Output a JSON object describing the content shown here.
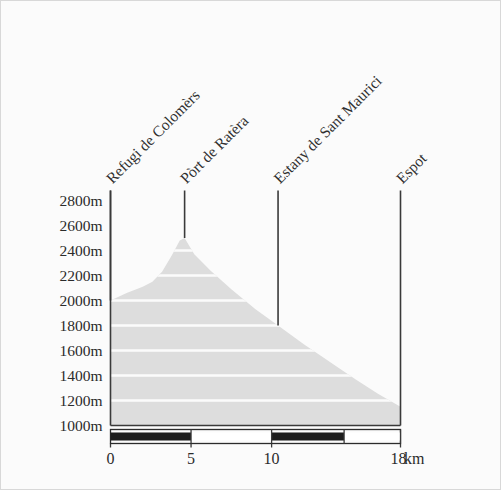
{
  "chart_data": {
    "type": "area",
    "title": "",
    "subtitle": "",
    "xlabel": "",
    "ylabel": "",
    "xunit": "km",
    "yunit": "m",
    "xlim": [
      0,
      18
    ],
    "ylim": [
      1000,
      2900
    ],
    "grid": true,
    "legend": "none",
    "x_ticks": [
      0,
      5,
      10,
      18
    ],
    "x_tick_labels": [
      "0",
      "5",
      "10",
      "18"
    ],
    "y_ticks": [
      1000,
      1200,
      1400,
      1600,
      1800,
      2000,
      2200,
      2400,
      2600,
      2800
    ],
    "y_tick_labels": [
      "1000m",
      "1200m",
      "1400m",
      "1600m",
      "1800m",
      "2000m",
      "2200m",
      "2400m",
      "2600m",
      "2800m"
    ],
    "series": [
      {
        "name": "elevation profile",
        "x": [
          0,
          1.0,
          2.0,
          2.6,
          3.2,
          3.8,
          4.3,
          4.6,
          5.2,
          6.2,
          7.5,
          9.0,
          10.4,
          12.0,
          13.6,
          15.2,
          16.6,
          18.0
        ],
        "values": [
          2000,
          2060,
          2110,
          2150,
          2230,
          2360,
          2480,
          2500,
          2370,
          2240,
          2090,
          1930,
          1800,
          1650,
          1510,
          1370,
          1255,
          1150
        ]
      }
    ],
    "annotations": [
      {
        "label": "Refugi de Colomèrs",
        "x_km": 0.0,
        "marker_top_m": 2880,
        "marker_bottom_m": 2000
      },
      {
        "label": "Pòrt de Ratèra",
        "x_km": 4.6,
        "marker_top_m": 2880,
        "marker_bottom_m": 2500
      },
      {
        "label": "Estany de Sant Maurici",
        "x_km": 10.4,
        "marker_top_m": 2880,
        "marker_bottom_m": 1800
      },
      {
        "label": "Espot",
        "x_km": 18.0,
        "marker_top_m": 2880,
        "marker_bottom_m": 1000
      }
    ],
    "scalebar": {
      "segments": [
        {
          "from_km": 0,
          "to_km": 5,
          "filled": true
        },
        {
          "from_km": 5,
          "to_km": 10,
          "filled": false
        },
        {
          "from_km": 10,
          "to_km": 14.5,
          "filled": true
        },
        {
          "from_km": 14.5,
          "to_km": 18,
          "filled": false
        }
      ]
    },
    "colors": {
      "terrain_fill": "#dddddd",
      "background": "#fbfbfb",
      "axis": "#3a3a3a",
      "text": "#2b2b2b",
      "gridline": "#fbfbfb",
      "scalebar_fill": "#1c1c1c"
    }
  }
}
